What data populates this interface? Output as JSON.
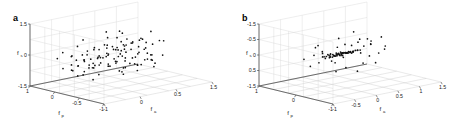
{
  "figure": {
    "panels": [
      {
        "letter": "a",
        "axes": {
          "vertical": {
            "label": "f",
            "sub": "s",
            "ticks": [
              "1.5",
              "0",
              "-1.5"
            ],
            "range": [
              -1.5,
              1.5
            ]
          },
          "depth": {
            "label": "f",
            "sub": "p",
            "ticks": [
              "1",
              "0",
              "-0.5",
              "-1"
            ],
            "range": [
              -1,
              1.5
            ]
          },
          "horizontal": {
            "label": "f",
            "sub": "a",
            "ticks": [
              "-1",
              "0",
              "0.5",
              "1.5"
            ],
            "range": [
              -1,
              1.5
            ]
          }
        }
      },
      {
        "letter": "b",
        "axes": {
          "vertical": {
            "label": "f",
            "sub": "s",
            "ticks": [
              "-1.5",
              "-0.5",
              "0",
              "0.5",
              "-1.5"
            ],
            "range": [
              -1.5,
              1.5
            ]
          },
          "depth": {
            "label": "f",
            "sub": "p",
            "ticks": [
              "1",
              "0",
              "-1"
            ],
            "range": [
              -1,
              1.5
            ]
          },
          "horizontal": {
            "label": "f",
            "sub": "a",
            "ticks": [
              "-1",
              "-0.5",
              "0",
              "0.5",
              "1",
              "1.5"
            ],
            "range": [
              -1,
              1.5
            ]
          }
        }
      }
    ]
  },
  "chart_data": [
    {
      "type": "scatter",
      "panel": "a",
      "title": "",
      "xlabel": "f_a",
      "ylabel": "f_p",
      "zlabel": "f_s",
      "xlim": [
        -1,
        1.5
      ],
      "ylim": [
        -1,
        1.5
      ],
      "zlim": [
        -1.5,
        1.5
      ],
      "grid": true,
      "legend": "none",
      "marker": "dot",
      "marker_color": "#111111",
      "n_points": 118,
      "points": [
        [
          -0.72,
          0.52,
          0.42
        ],
        [
          -0.55,
          0.86,
          0.95
        ],
        [
          -0.3,
          0.6,
          1.1
        ],
        [
          0.1,
          0.42,
          1.18
        ],
        [
          0.35,
          0.15,
          0.88
        ],
        [
          -0.88,
          0.22,
          0.3
        ],
        [
          -0.62,
          0.05,
          0.62
        ],
        [
          -0.4,
          0.3,
          0.55
        ],
        [
          -0.18,
          0.7,
          0.5
        ],
        [
          0.05,
          0.55,
          0.3
        ],
        [
          0.28,
          0.38,
          0.42
        ],
        [
          0.52,
          0.2,
          0.35
        ],
        [
          0.72,
          -0.05,
          0.18
        ],
        [
          -0.95,
          -0.15,
          0.1
        ],
        [
          -0.7,
          0.4,
          0.05
        ],
        [
          -0.48,
          0.62,
          0.22
        ],
        [
          -0.25,
          0.48,
          0.12
        ],
        [
          -0.05,
          0.25,
          0.02
        ],
        [
          0.18,
          0.1,
          0.15
        ],
        [
          0.4,
          -0.1,
          0.08
        ],
        [
          0.62,
          0.05,
          -0.05
        ],
        [
          0.88,
          0.18,
          0.22
        ],
        [
          -0.8,
          0.7,
          -0.12
        ],
        [
          -0.58,
          0.52,
          -0.05
        ],
        [
          -0.35,
          0.35,
          0.08
        ],
        [
          -0.12,
          0.18,
          -0.1
        ],
        [
          0.08,
          0.02,
          -0.02
        ],
        [
          0.3,
          0.22,
          -0.18
        ],
        [
          0.55,
          0.38,
          -0.12
        ],
        [
          0.78,
          0.52,
          -0.22
        ],
        [
          -0.9,
          0.3,
          -0.35
        ],
        [
          -0.65,
          0.12,
          -0.28
        ],
        [
          -0.42,
          -0.02,
          -0.15
        ],
        [
          -0.2,
          0.22,
          -0.3
        ],
        [
          0.02,
          0.4,
          -0.25
        ],
        [
          0.25,
          0.55,
          -0.4
        ],
        [
          0.48,
          0.3,
          -0.32
        ],
        [
          0.7,
          0.08,
          -0.45
        ],
        [
          0.92,
          -0.12,
          -0.38
        ],
        [
          -0.75,
          -0.25,
          -0.5
        ],
        [
          -0.52,
          -0.08,
          -0.42
        ],
        [
          -0.28,
          0.1,
          -0.55
        ],
        [
          -0.08,
          0.3,
          -0.48
        ],
        [
          0.15,
          0.48,
          -0.6
        ],
        [
          0.38,
          0.62,
          -0.52
        ],
        [
          0.6,
          0.42,
          -0.65
        ],
        [
          0.82,
          0.22,
          -0.58
        ],
        [
          1.02,
          0.02,
          -0.7
        ],
        [
          -0.6,
          0.75,
          0.7
        ],
        [
          -0.38,
          0.88,
          0.8
        ],
        [
          -0.15,
          0.95,
          0.6
        ],
        [
          0.2,
          0.72,
          0.72
        ],
        [
          0.45,
          0.58,
          0.65
        ],
        [
          0.68,
          0.35,
          0.52
        ],
        [
          -0.85,
          0.55,
          0.48
        ],
        [
          -0.48,
          0.18,
          0.38
        ],
        [
          -0.22,
          0.02,
          0.28
        ],
        [
          0.0,
          0.15,
          0.45
        ],
        [
          0.22,
          0.3,
          0.58
        ],
        [
          0.5,
          0.48,
          0.28
        ],
        [
          -0.68,
          -0.05,
          0.15
        ],
        [
          -0.45,
          0.25,
          0.0
        ],
        [
          -0.02,
          0.62,
          0.2
        ],
        [
          0.32,
          0.05,
          0.05
        ],
        [
          0.58,
          -0.15,
          0.12
        ],
        [
          0.8,
          0.28,
          0.02
        ],
        [
          -0.92,
          0.45,
          0.22
        ],
        [
          -0.55,
          0.68,
          0.35
        ],
        [
          -0.3,
          0.82,
          0.15
        ],
        [
          0.12,
          0.35,
          -0.08
        ],
        [
          0.42,
          0.12,
          0.22
        ],
        [
          0.65,
          0.45,
          0.08
        ],
        [
          -0.78,
          0.08,
          -0.2
        ],
        [
          -0.5,
          0.38,
          -0.35
        ],
        [
          -0.25,
          0.55,
          -0.22
        ],
        [
          0.05,
          0.68,
          -0.15
        ],
        [
          0.35,
          0.25,
          -0.28
        ],
        [
          0.55,
          -0.02,
          -0.18
        ],
        [
          0.85,
          0.38,
          -0.3
        ],
        [
          -0.88,
          0.62,
          -0.45
        ],
        [
          -0.62,
          0.28,
          -0.52
        ],
        [
          -0.35,
          0.05,
          -0.4
        ],
        [
          -0.1,
          -0.12,
          -0.58
        ],
        [
          0.18,
          0.18,
          -0.48
        ],
        [
          0.45,
          0.42,
          -0.55
        ],
        [
          0.72,
          0.62,
          -0.42
        ],
        [
          0.95,
          0.25,
          -0.62
        ],
        [
          -0.7,
          0.9,
          0.05
        ],
        [
          -0.4,
          0.72,
          0.68
        ],
        [
          1.1,
          0.45,
          0.3
        ],
        [
          -1.05,
          0.18,
          0.55
        ],
        [
          0.28,
          0.88,
          0.92
        ],
        [
          0.62,
          0.72,
          1.05
        ],
        [
          -0.18,
          0.38,
          1.25
        ],
        [
          0.48,
          -0.22,
          0.48
        ],
        [
          -0.32,
          -0.2,
          0.72
        ],
        [
          0.9,
          0.6,
          0.45
        ],
        [
          -0.98,
          0.8,
          0.38
        ],
        [
          0.05,
          -0.25,
          -0.35
        ],
        [
          0.75,
          -0.28,
          0.28
        ],
        [
          -0.15,
          0.98,
          -0.28
        ],
        [
          0.38,
          0.95,
          0.18
        ],
        [
          -0.52,
          0.95,
          0.52
        ],
        [
          1.05,
          0.15,
          0.05
        ],
        [
          -1.1,
          0.55,
          -0.15
        ],
        [
          0.2,
          -0.05,
          -0.72
        ],
        [
          0.68,
          0.18,
          -0.78
        ],
        [
          -0.42,
          0.48,
          -0.68
        ],
        [
          -0.05,
          0.72,
          -0.62
        ],
        [
          0.88,
          0.48,
          -0.68
        ],
        [
          -0.82,
          0.35,
          -0.62
        ],
        [
          0.32,
          0.7,
          -0.72
        ],
        [
          0.58,
          0.88,
          -0.58
        ],
        [
          -0.65,
          0.62,
          -0.78
        ],
        [
          1.18,
          0.3,
          -0.48
        ],
        [
          -0.22,
          0.88,
          -0.45
        ],
        [
          0.12,
          0.52,
          -0.88
        ],
        [
          0.45,
          -0.18,
          -0.65
        ]
      ]
    },
    {
      "type": "scatter",
      "panel": "b",
      "title": "",
      "xlabel": "f_a",
      "ylabel": "f_p",
      "zlabel": "f_s",
      "xlim": [
        -1,
        1.5
      ],
      "ylim": [
        -1,
        1.5
      ],
      "zlim": [
        -1.5,
        1.5
      ],
      "grid": true,
      "legend": "none",
      "marker": "dot",
      "marker_color": "#111111",
      "n_points": 96,
      "points": [
        [
          -0.1,
          0.18,
          0.05
        ],
        [
          -0.05,
          0.22,
          0.02
        ],
        [
          0.0,
          0.2,
          0.0
        ],
        [
          0.05,
          0.15,
          0.03
        ],
        [
          0.1,
          0.18,
          -0.02
        ],
        [
          0.15,
          0.22,
          0.04
        ],
        [
          0.2,
          0.2,
          0.01
        ],
        [
          0.25,
          0.16,
          -0.03
        ],
        [
          0.3,
          0.19,
          0.02
        ],
        [
          -0.15,
          0.16,
          -0.04
        ],
        [
          -0.2,
          0.2,
          0.06
        ],
        [
          -0.08,
          0.24,
          -0.01
        ],
        [
          0.02,
          0.12,
          0.05
        ],
        [
          0.08,
          0.25,
          -0.05
        ],
        [
          0.12,
          0.14,
          0.0
        ],
        [
          0.18,
          0.21,
          0.03
        ],
        [
          0.22,
          0.17,
          -0.02
        ],
        [
          0.28,
          0.23,
          0.01
        ],
        [
          -0.12,
          0.13,
          0.03
        ],
        [
          -0.18,
          0.22,
          -0.02
        ],
        [
          -0.02,
          0.19,
          0.04
        ],
        [
          0.04,
          0.21,
          -0.04
        ],
        [
          0.14,
          0.16,
          0.02
        ],
        [
          0.24,
          0.18,
          -0.01
        ],
        [
          0.34,
          0.22,
          0.03
        ],
        [
          0.38,
          0.15,
          -0.03
        ],
        [
          -0.25,
          0.18,
          0.02
        ],
        [
          -0.06,
          0.26,
          0.0
        ],
        [
          0.06,
          0.1,
          -0.02
        ],
        [
          0.16,
          0.24,
          0.05
        ],
        [
          0.26,
          0.12,
          -0.04
        ],
        [
          0.36,
          0.2,
          0.01
        ],
        [
          -0.22,
          0.24,
          -0.03
        ],
        [
          -0.16,
          0.1,
          0.04
        ],
        [
          -0.04,
          0.15,
          -0.05
        ],
        [
          0.09,
          0.2,
          0.02
        ],
        [
          0.19,
          0.13,
          0.0
        ],
        [
          0.29,
          0.25,
          -0.02
        ],
        [
          0.42,
          0.18,
          0.03
        ],
        [
          -0.28,
          0.15,
          0.01
        ],
        [
          -0.01,
          0.28,
          0.06
        ],
        [
          0.11,
          0.08,
          -0.06
        ],
        [
          0.21,
          0.26,
          0.02
        ],
        [
          0.31,
          0.11,
          -0.01
        ],
        [
          0.45,
          0.22,
          0.04
        ],
        [
          -0.3,
          0.22,
          -0.04
        ],
        [
          -0.09,
          0.09,
          0.05
        ],
        [
          0.03,
          0.27,
          -0.02
        ],
        [
          0.13,
          0.19,
          0.01
        ],
        [
          0.23,
          0.14,
          -0.03
        ],
        [
          0.33,
          0.24,
          0.02
        ],
        [
          0.48,
          0.16,
          0.0
        ],
        [
          -0.14,
          0.28,
          0.03
        ],
        [
          -0.03,
          0.11,
          -0.04
        ],
        [
          0.07,
          0.23,
          0.05
        ],
        [
          0.17,
          0.1,
          -0.01
        ],
        [
          0.27,
          0.21,
          0.02
        ],
        [
          0.4,
          0.13,
          -0.05
        ],
        [
          0.52,
          0.2,
          0.01
        ],
        [
          -0.35,
          0.2,
          0.05
        ],
        [
          -0.42,
          0.3,
          0.28
        ],
        [
          -0.38,
          0.12,
          -0.25
        ],
        [
          0.55,
          0.28,
          0.22
        ],
        [
          0.6,
          0.1,
          -0.2
        ],
        [
          -0.48,
          0.38,
          0.42
        ],
        [
          0.66,
          0.35,
          0.3
        ],
        [
          0.15,
          0.45,
          0.48
        ],
        [
          0.05,
          -0.08,
          -0.42
        ],
        [
          -0.2,
          0.48,
          0.55
        ],
        [
          0.35,
          -0.12,
          -0.38
        ],
        [
          -0.55,
          0.25,
          0.6
        ],
        [
          0.72,
          0.22,
          -0.35
        ],
        [
          0.25,
          0.52,
          0.62
        ],
        [
          -0.05,
          0.55,
          -0.48
        ],
        [
          0.45,
          0.4,
          -0.52
        ],
        [
          -0.62,
          0.18,
          -0.3
        ],
        [
          0.8,
          0.15,
          0.15
        ],
        [
          -0.12,
          0.62,
          0.7
        ],
        [
          0.58,
          0.48,
          0.52
        ],
        [
          0.2,
          -0.18,
          -0.6
        ],
        [
          -0.3,
          0.58,
          -0.55
        ],
        [
          0.88,
          0.3,
          -0.25
        ],
        [
          -0.7,
          0.42,
          0.35
        ],
        [
          0.4,
          0.62,
          0.75
        ],
        [
          -0.25,
          -0.1,
          0.45
        ],
        [
          0.68,
          -0.05,
          0.38
        ],
        [
          0.1,
          0.72,
          -0.65
        ],
        [
          -0.45,
          0.68,
          0.25
        ],
        [
          0.95,
          0.42,
          0.1
        ],
        [
          -0.08,
          0.35,
          0.88
        ],
        [
          0.5,
          0.75,
          -0.4
        ],
        [
          -0.85,
          0.3,
          0.18
        ],
        [
          0.3,
          0.3,
          1.02
        ],
        [
          0.75,
          0.58,
          0.68
        ],
        [
          -0.38,
          0.85,
          0.52
        ],
        [
          1.05,
          0.25,
          -0.15
        ]
      ]
    }
  ]
}
